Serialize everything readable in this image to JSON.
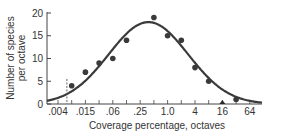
{
  "chart_data": {
    "type": "scatter",
    "title": "",
    "xlabel": "Coverage percentage, octaves",
    "ylabel_lines": [
      "Number of species",
      "per octave"
    ],
    "ylabel": "Number of species per octave",
    "x_scale": "log2 (octaves)",
    "x_tick_labels": [
      ".004",
      ".015",
      ".06",
      ".25",
      "1.0",
      "4",
      "16",
      "64"
    ],
    "x_tick_values": [
      0.004,
      0.015,
      0.06,
      0.25,
      1.0,
      4,
      16,
      64
    ],
    "y_tick_labels": [
      "0",
      "5",
      "10",
      "15",
      "20"
    ],
    "y_tick_values": [
      0,
      5,
      10,
      15,
      20
    ],
    "ylim": [
      0,
      20
    ],
    "xlim_octaves": [
      -8.8,
      6.9
    ],
    "grid": false,
    "legend": null,
    "series": [
      {
        "name": "Observed species per octave",
        "marker": "circle",
        "x_octave": [
          -7,
          -6,
          -5,
          -4,
          -3,
          -1,
          0,
          1,
          2,
          3,
          5
        ],
        "x": [
          0.0078,
          0.015,
          0.03,
          0.06,
          0.125,
          0.5,
          1.0,
          2,
          4,
          8,
          32
        ],
        "values": [
          4,
          7,
          9,
          10,
          14,
          19,
          15,
          14,
          8,
          5,
          1
        ]
      },
      {
        "name": "Observed (zero/marker at 16)",
        "marker": "triangle",
        "x_octave": [
          4
        ],
        "x": [
          16
        ],
        "values": [
          0
        ]
      },
      {
        "name": "Fitted lognormal curve",
        "type": "line",
        "peak_octave": -1.4,
        "peak_value": 18,
        "sigma_octaves": 2.9
      }
    ],
    "annotations": [
      {
        "type": "dashed-vertical-line",
        "x_octave": -7.35,
        "y_from": 0,
        "y_to": 5.5,
        "description": "veil line"
      }
    ]
  }
}
